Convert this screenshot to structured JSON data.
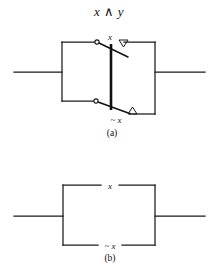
{
  "figure": {
    "title": "x ∧ y",
    "caption_a": "(a)",
    "caption_b": "(b)"
  },
  "panel_a": {
    "label_top_switch": "x",
    "label_bottom_switch": "~ x"
  },
  "panel_b": {
    "label_top_branch": "x",
    "label_bottom_branch": "~ x"
  },
  "style": {
    "ink": "#1a1a1a",
    "paper": "#ffffff"
  }
}
